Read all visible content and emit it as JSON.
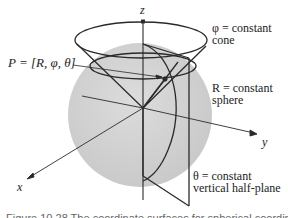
{
  "figure": {
    "type": "spherical-coordinates-diagram",
    "axes": {
      "x": "x",
      "y": "y",
      "z": "z"
    },
    "point_label": "P = [R, φ, θ]",
    "annotations": [
      {
        "id": "cone",
        "line1": "φ = constant",
        "line2": "cone"
      },
      {
        "id": "sphere",
        "line1": "R = constant",
        "line2": "sphere"
      },
      {
        "id": "halfplane",
        "line1": "θ = constant",
        "line2": "vertical half-plane"
      }
    ],
    "colors": {
      "sphere_fill": "#d4d4d4",
      "line": "#2a2a2a",
      "background": "#ffffff"
    }
  },
  "caption": "Figure 10.28   The coordinate surfaces for spherical coordinates"
}
